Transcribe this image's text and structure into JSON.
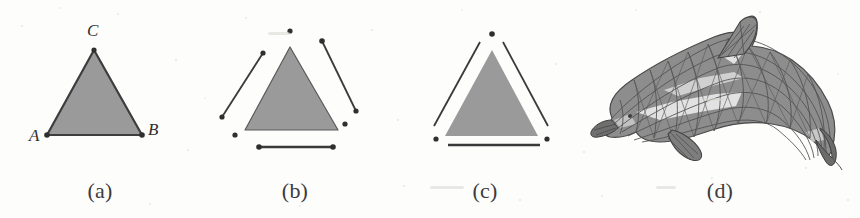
{
  "figure": {
    "background_color": "#fdfdfc",
    "ink_color": "#3a3a3a",
    "fill_gray": "#9a9a9a",
    "panel_count": 4
  },
  "panels": [
    {
      "id": "a",
      "caption": "(a)",
      "description": "Filled triangle with labeled vertices A, B, C",
      "vertex_labels": [
        {
          "text": "A",
          "position": "bottom-left"
        },
        {
          "text": "B",
          "position": "bottom-right"
        },
        {
          "text": "C",
          "position": "top"
        }
      ],
      "geometry": {
        "triangle": [
          [
            94,
            50
          ],
          [
            47,
            135
          ],
          [
            142,
            135
          ]
        ],
        "vertex_dots": [
          [
            94,
            50
          ],
          [
            47,
            135
          ],
          [
            142,
            135
          ]
        ],
        "outlined": true,
        "filled": true
      }
    },
    {
      "id": "b",
      "caption": "(b)",
      "description": "Exploded view: triangle face, three detached edges, three detached vertices",
      "vertex_labels": [],
      "geometry": {
        "triangle": [
          [
            290,
            47
          ],
          [
            245,
            130
          ],
          [
            338,
            130
          ]
        ],
        "edges": [
          {
            "name": "edge-left",
            "from": [
              263,
              53
            ],
            "to": [
              222,
              117
            ]
          },
          {
            "name": "edge-right",
            "from": [
              322,
              41
            ],
            "to": [
              356,
              111
            ]
          },
          {
            "name": "edge-bottom",
            "from": [
              259,
              147
            ],
            "to": [
              333,
              147
            ]
          }
        ],
        "vertex_dots": [
          [
            290,
            31
          ],
          [
            235,
            135
          ],
          [
            345,
            124
          ]
        ],
        "outlined": false,
        "filled": true
      }
    },
    {
      "id": "c",
      "caption": "(c)",
      "description": "Slightly exploded view: triangle face with three nearby edges and three vertices",
      "vertex_labels": [],
      "geometry": {
        "triangle": [
          [
            492,
            50
          ],
          [
            445,
            136
          ],
          [
            538,
            136
          ]
        ],
        "edges": [
          {
            "name": "edge-left",
            "from": [
              480,
              42
            ],
            "to": [
              434,
              126
            ]
          },
          {
            "name": "edge-right",
            "from": [
              503,
              42
            ],
            "to": [
              548,
              126
            ]
          },
          {
            "name": "edge-bottom",
            "from": [
              448,
              145
            ],
            "to": [
              540,
              145
            ]
          }
        ],
        "vertex_dots": [
          [
            492,
            34
          ],
          [
            436,
            139
          ],
          [
            547,
            139
          ]
        ],
        "outlined": false,
        "filled": true
      }
    },
    {
      "id": "d",
      "caption": "(d)",
      "description": "Triangulated wireframe dolphin mesh, arching body with dorsal fin, beak, pectoral fin and tail fluke",
      "vertex_labels": [],
      "geometry": {
        "mesh_bounds": [
          605,
          15,
          835,
          162
        ],
        "shading": "dark gray triangles with light highlight bands along the flank and dorsal ridge",
        "outlined": true,
        "filled": true
      }
    }
  ]
}
